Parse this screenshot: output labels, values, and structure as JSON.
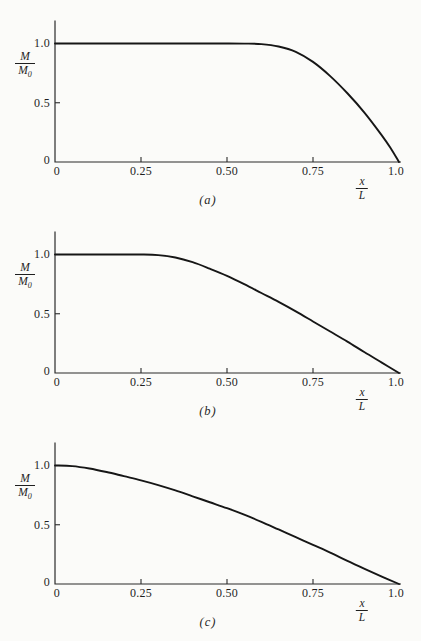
{
  "page": {
    "background": "#fbfbf9",
    "axis_color": "#2b2b2b",
    "curve_color": "#161616",
    "text_color": "#1f1f1f"
  },
  "chart_data": [
    {
      "type": "line",
      "caption": "(a)",
      "xlabel": "x/L",
      "ylabel": "M/M₀",
      "xlim": [
        0,
        1.0
      ],
      "ylim": [
        0,
        1.0
      ],
      "grid": false,
      "legend": null,
      "x_tick_values": [
        0,
        0.25,
        0.5,
        0.75,
        1.0
      ],
      "x_tick_labels": [
        "0",
        "0.25",
        "0.50",
        "0.75",
        "1.0"
      ],
      "y_tick_values": [
        1.0,
        0.5,
        0
      ],
      "y_tick_labels": [
        "1.0",
        "0.5",
        "0"
      ],
      "axis_label_parts": {
        "y_numerator": "M",
        "y_denominator": "M",
        "y_denominator_subscript": "0",
        "x_numerator": "x",
        "x_denominator": "L"
      },
      "series": [
        {
          "name": "moment-ratio",
          "x": [
            0,
            0.1,
            0.2,
            0.3,
            0.4,
            0.5,
            0.55,
            0.6,
            0.65,
            0.7,
            0.75,
            0.8,
            0.85,
            0.9,
            0.95,
            0.975,
            1.0
          ],
          "y": [
            1.0,
            1.0,
            1.0,
            1.0,
            1.0,
            1.0,
            0.999,
            0.995,
            0.975,
            0.93,
            0.845,
            0.725,
            0.58,
            0.415,
            0.225,
            0.12,
            0
          ]
        }
      ]
    },
    {
      "type": "line",
      "caption": "(b)",
      "xlabel": "x/L",
      "ylabel": "M/M₀",
      "xlim": [
        0,
        1.0
      ],
      "ylim": [
        0,
        1.0
      ],
      "grid": false,
      "legend": null,
      "x_tick_values": [
        0,
        0.25,
        0.5,
        0.75,
        1.0
      ],
      "x_tick_labels": [
        "0",
        "0.25",
        "0.50",
        "0.75",
        "1.0"
      ],
      "y_tick_values": [
        1.0,
        0.5,
        0
      ],
      "y_tick_labels": [
        "1.0",
        "0.5",
        "0"
      ],
      "axis_label_parts": {
        "y_numerator": "M",
        "y_denominator": "M",
        "y_denominator_subscript": "0",
        "x_numerator": "x",
        "x_denominator": "L"
      },
      "series": [
        {
          "name": "moment-ratio",
          "x": [
            0,
            0.1,
            0.2,
            0.25,
            0.3,
            0.35,
            0.4,
            0.45,
            0.5,
            0.55,
            0.6,
            0.65,
            0.7,
            0.75,
            0.8,
            0.85,
            0.9,
            0.95,
            1.0
          ],
          "y": [
            1.0,
            1.0,
            1.0,
            1.0,
            0.995,
            0.975,
            0.935,
            0.88,
            0.82,
            0.75,
            0.675,
            0.6,
            0.52,
            0.435,
            0.35,
            0.265,
            0.175,
            0.088,
            0
          ]
        }
      ]
    },
    {
      "type": "line",
      "caption": "(c)",
      "xlabel": "x/L",
      "ylabel": "M/M₀",
      "xlim": [
        0,
        1.0
      ],
      "ylim": [
        0,
        1.0
      ],
      "grid": false,
      "legend": null,
      "x_tick_values": [
        0,
        0.25,
        0.5,
        0.75,
        1.0
      ],
      "x_tick_labels": [
        "0",
        "0.25",
        "0.50",
        "0.75",
        "1.0"
      ],
      "y_tick_values": [
        1.0,
        0.5,
        0
      ],
      "y_tick_labels": [
        "1.0",
        "0.5",
        "0"
      ],
      "axis_label_parts": {
        "y_numerator": "M",
        "y_denominator": "M",
        "y_denominator_subscript": "0",
        "x_numerator": "x",
        "x_denominator": "L"
      },
      "series": [
        {
          "name": "moment-ratio",
          "x": [
            0,
            0.05,
            0.1,
            0.15,
            0.2,
            0.25,
            0.3,
            0.35,
            0.4,
            0.45,
            0.5,
            0.55,
            0.6,
            0.65,
            0.7,
            0.75,
            0.8,
            0.85,
            0.9,
            0.95,
            1.0
          ],
          "y": [
            1.0,
            0.995,
            0.975,
            0.945,
            0.91,
            0.875,
            0.835,
            0.79,
            0.74,
            0.69,
            0.64,
            0.585,
            0.525,
            0.46,
            0.395,
            0.33,
            0.265,
            0.195,
            0.128,
            0.063,
            0
          ]
        }
      ]
    }
  ]
}
